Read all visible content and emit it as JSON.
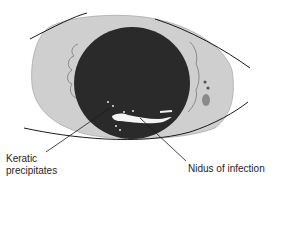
{
  "diagram": {
    "labels": {
      "keratic_precipitates_line1": "Keratic",
      "keratic_precipitates_line2": "precipitates",
      "nidus": "Nidus of infection"
    },
    "colors": {
      "background": "#ffffff",
      "sclera": "#cfcfcf",
      "cornea": "#2a2a2a",
      "lines": "#1a1a1a",
      "nidus": "#f4f4f4"
    }
  }
}
